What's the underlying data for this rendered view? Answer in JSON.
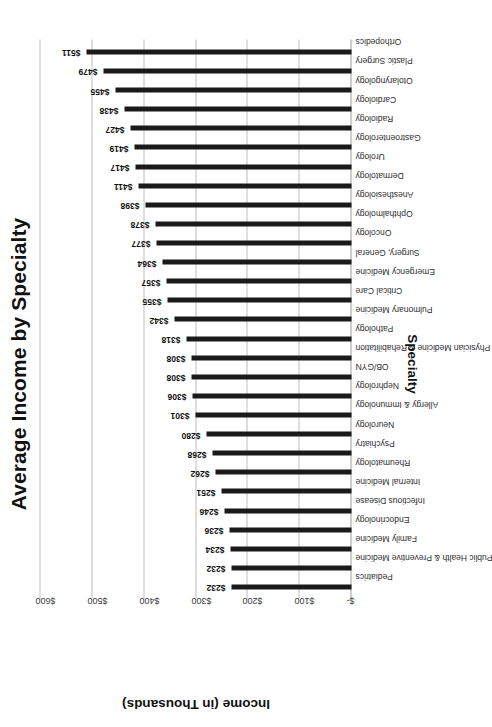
{
  "chart_data": {
    "type": "bar",
    "title": "Average Income by Specialty",
    "xlabel": "Specialty",
    "ylabel": "Income (in Thousands)",
    "ylim": [
      0,
      600
    ],
    "grid": true,
    "legend": "none",
    "orientation": "vertical-bars-page-rotated-90",
    "value_prefix": "$",
    "ytick_labels": [
      "$-",
      "$100",
      "$200",
      "$300",
      "$400",
      "$500",
      "$600"
    ],
    "ytick_values": [
      0,
      100,
      200,
      300,
      400,
      500,
      600
    ],
    "categories": [
      "Pediatrics",
      "Public Health & Preventive Medicine",
      "Family Medicine",
      "Endocrinology",
      "Infectious Disease",
      "Internal Medicine",
      "Rheumatology",
      "Psychiatry",
      "Neurology",
      "Allergy & Immunology",
      "Nephrology",
      "OB/GYN",
      "Physician Medicine & Rehabilitation",
      "Pathology",
      "Pulmonary Medicine",
      "Critical Care",
      "Emergency Medicine",
      "Surgery, General",
      "Oncology",
      "Ophthalmology",
      "Anesthesiology",
      "Dermatology",
      "Urology",
      "Gastroenterology",
      "Radiology",
      "Cardiology",
      "Otolaryngology",
      "Plastic Surgery",
      "Orthopedics"
    ],
    "values": [
      232,
      232,
      234,
      236,
      246,
      251,
      262,
      268,
      280,
      301,
      306,
      308,
      308,
      318,
      342,
      355,
      357,
      364,
      377,
      378,
      398,
      411,
      417,
      419,
      427,
      438,
      455,
      479,
      511
    ],
    "data_labels": [
      "$232",
      "$232",
      "$234",
      "$236",
      "$246",
      "$251",
      "$262",
      "$268",
      "$280",
      "$301",
      "$306",
      "$308",
      "$308",
      "$318",
      "$342",
      "$355",
      "$357",
      "$364",
      "$377",
      "$378",
      "$398",
      "$411",
      "$417",
      "$419",
      "$427",
      "$438",
      "$455",
      "$479",
      "$511"
    ],
    "colors": {
      "bar": "#1a1a1a",
      "gridline": "#bdbdbd",
      "text": "#111111",
      "background": "#ffffff"
    }
  }
}
